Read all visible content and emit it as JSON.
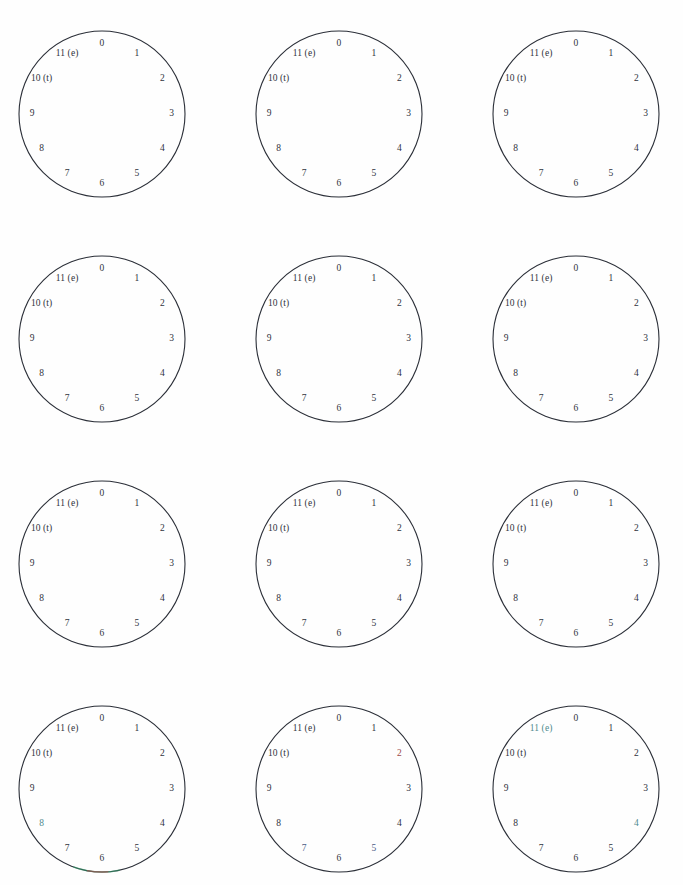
{
  "page": {
    "header_sliver_text": "",
    "background_color": "#fefefe",
    "width": 683,
    "height": 885
  },
  "diagram": {
    "type": "grid-of-clock-dials",
    "rows": 4,
    "columns": 3,
    "dial_count": 12,
    "positions_per_dial": 12,
    "stroke_color": "#2b2f38",
    "stroke_width": 1.1,
    "label_color": "#30333c",
    "label_font_size_px": 9.5,
    "circle_diameter_px": 168,
    "label_radius_fraction": 0.84,
    "dial_labels": [
      "0",
      "1",
      "2",
      "3",
      "4",
      "5",
      "6",
      "7",
      "8",
      "9",
      "10 (t)",
      "11 (e)"
    ],
    "label_angles_deg": [
      0,
      30,
      60,
      90,
      120,
      150,
      180,
      210,
      240,
      270,
      300,
      330
    ],
    "dials": [
      {
        "id": "dial-r1c1",
        "row": 1,
        "column": 1,
        "left": 18,
        "top": 30,
        "hands": [],
        "marked_labels": [],
        "arc_highlights": []
      },
      {
        "id": "dial-r1c2",
        "row": 1,
        "column": 2,
        "left": 255,
        "top": 30,
        "hands": [],
        "marked_labels": [],
        "arc_highlights": []
      },
      {
        "id": "dial-r1c3",
        "row": 1,
        "column": 3,
        "left": 492,
        "top": 30,
        "hands": [],
        "marked_labels": [],
        "arc_highlights": []
      },
      {
        "id": "dial-r2c1",
        "row": 2,
        "column": 1,
        "left": 18,
        "top": 255,
        "hands": [],
        "marked_labels": [],
        "arc_highlights": []
      },
      {
        "id": "dial-r2c2",
        "row": 2,
        "column": 2,
        "left": 255,
        "top": 255,
        "hands": [],
        "marked_labels": [],
        "arc_highlights": []
      },
      {
        "id": "dial-r2c3",
        "row": 2,
        "column": 3,
        "left": 492,
        "top": 255,
        "hands": [],
        "marked_labels": [],
        "arc_highlights": []
      },
      {
        "id": "dial-r3c1",
        "row": 3,
        "column": 1,
        "left": 18,
        "top": 480,
        "hands": [],
        "marked_labels": [],
        "arc_highlights": []
      },
      {
        "id": "dial-r3c2",
        "row": 3,
        "column": 2,
        "left": 255,
        "top": 480,
        "hands": [],
        "marked_labels": [],
        "arc_highlights": []
      },
      {
        "id": "dial-r3c3",
        "row": 3,
        "column": 3,
        "left": 492,
        "top": 480,
        "hands": [],
        "marked_labels": [],
        "arc_highlights": []
      },
      {
        "id": "dial-r4c1",
        "row": 4,
        "column": 1,
        "left": 18,
        "top": 705,
        "hands": [],
        "marked_labels": [
          {
            "index": 8,
            "tint": "tint-teal"
          }
        ],
        "arc_highlights": [
          {
            "start_deg": 168,
            "end_deg": 200,
            "color": "#2f9d6a"
          },
          {
            "start_deg": 176,
            "end_deg": 190,
            "color": "#b04a4a"
          }
        ]
      },
      {
        "id": "dial-r4c2",
        "row": 4,
        "column": 2,
        "left": 255,
        "top": 705,
        "hands": [],
        "marked_labels": [
          {
            "index": 2,
            "tint": "tint-red"
          },
          {
            "index": 5,
            "tint": "tint-blue"
          },
          {
            "index": 7,
            "tint": "tint-blue"
          }
        ],
        "arc_highlights": []
      },
      {
        "id": "dial-r4c3",
        "row": 4,
        "column": 3,
        "left": 492,
        "top": 705,
        "hands": [],
        "marked_labels": [
          {
            "index": 11,
            "tint": "tint-teal"
          },
          {
            "index": 4,
            "tint": "tint-teal"
          }
        ],
        "arc_highlights": []
      }
    ]
  }
}
